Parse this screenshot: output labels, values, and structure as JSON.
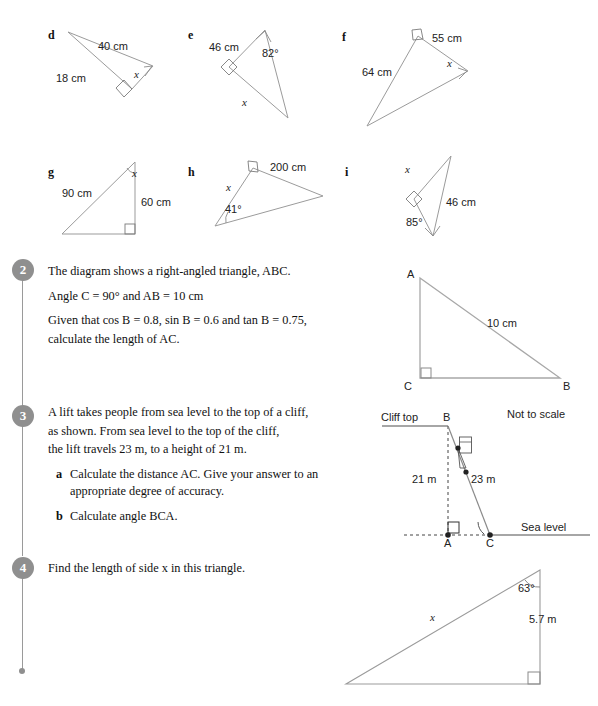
{
  "worksheet": {
    "parts": [
      {
        "letter": "d",
        "labels": [
          {
            "text": "40 cm",
            "kind": "length"
          },
          {
            "text": "18 cm",
            "kind": "length"
          },
          {
            "text": "x",
            "kind": "variable"
          }
        ]
      },
      {
        "letter": "e",
        "labels": [
          {
            "text": "46 cm",
            "kind": "length"
          },
          {
            "text": "82°",
            "kind": "angle"
          },
          {
            "text": "x",
            "kind": "variable"
          }
        ]
      },
      {
        "letter": "f",
        "labels": [
          {
            "text": "55 cm",
            "kind": "length"
          },
          {
            "text": "64 cm",
            "kind": "length"
          },
          {
            "text": "x",
            "kind": "variable"
          }
        ]
      },
      {
        "letter": "g",
        "labels": [
          {
            "text": "90 cm",
            "kind": "length"
          },
          {
            "text": "60 cm",
            "kind": "length"
          },
          {
            "text": "x",
            "kind": "variable"
          }
        ]
      },
      {
        "letter": "h",
        "labels": [
          {
            "text": "200 cm",
            "kind": "length"
          },
          {
            "text": "41°",
            "kind": "angle"
          },
          {
            "text": "x",
            "kind": "variable"
          }
        ]
      },
      {
        "letter": "i",
        "labels": [
          {
            "text": "46 cm",
            "kind": "length"
          },
          {
            "text": "85°",
            "kind": "angle"
          },
          {
            "text": "x",
            "kind": "variable"
          }
        ]
      }
    ],
    "questions": [
      {
        "number": "2",
        "lines": [
          "The diagram shows a right-angled triangle, ABC.",
          "Angle C = 90° and AB = 10 cm",
          "Given that cos B = 0.8, sin B = 0.6 and tan B = 0.75,",
          "calculate the length of AC."
        ],
        "diagram": {
          "vertex_a": "A",
          "vertex_b": "B",
          "vertex_c": "C",
          "hypotenuse_label": "10 cm"
        }
      },
      {
        "number": "3",
        "lines": [
          "A lift takes people from sea level to the top of a cliff,",
          "as shown. From sea level to the top of the cliff,",
          "the lift travels 23 m, to a height of 21 m."
        ],
        "subparts": [
          {
            "label": "a",
            "text": "Calculate the distance AC. Give your answer to an appropriate degree of accuracy."
          },
          {
            "label": "b",
            "text": "Calculate angle BCA."
          }
        ],
        "diagram": {
          "cliff_top_label": "Cliff top",
          "sea_level_label": "Sea level",
          "not_to_scale_label": "Not to scale",
          "height_label": "21 m",
          "lift_label": "23 m",
          "vertex_a": "A",
          "vertex_b": "B",
          "vertex_c": "C"
        }
      },
      {
        "number": "4",
        "lines": [
          "Find the length of side x in this triangle."
        ],
        "diagram": {
          "angle_label": "63°",
          "side_label": "5.7 m",
          "hypotenuse_label": "x"
        }
      }
    ],
    "colors": {
      "marker_gray": "#8f8f8f",
      "rule_gray": "#9a9a9a",
      "stroke_gray": "#9b9b9b",
      "stroke_dark": "#6f6f6f",
      "text": "#111111"
    }
  }
}
